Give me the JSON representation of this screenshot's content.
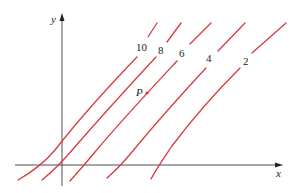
{
  "diagram": {
    "axes": {
      "x_label": "x",
      "y_label": "y"
    },
    "colors": {
      "curve": "#d83a3f",
      "axis": "#3a3a3a",
      "point": "#d83a3f"
    },
    "curves": [
      {
        "level": "10",
        "label": "10"
      },
      {
        "level": "8",
        "label": "8"
      },
      {
        "level": "6",
        "label": "6"
      },
      {
        "level": "4",
        "label": "4"
      },
      {
        "level": "2",
        "label": "2"
      }
    ],
    "point": {
      "label": "P",
      "on_curve": "6"
    }
  }
}
